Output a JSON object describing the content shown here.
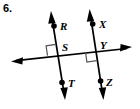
{
  "problem": {
    "number": "6."
  },
  "figure": {
    "type": "geometry-diagram",
    "stroke_color": "#000000",
    "background_color": "#ffffff",
    "points": [
      {
        "id": "R",
        "label": "R",
        "x": 54,
        "y": 26,
        "label_x": 60,
        "label_y": 29
      },
      {
        "id": "S",
        "label": "S",
        "x": 58,
        "y": 54,
        "label_x": 62,
        "label_y": 50
      },
      {
        "id": "T",
        "label": "T",
        "x": 62,
        "y": 83,
        "label_x": 67,
        "label_y": 86
      },
      {
        "id": "X",
        "label": "X",
        "x": 93,
        "y": 24,
        "label_x": 99,
        "label_y": 27
      },
      {
        "id": "Y",
        "label": "Y",
        "x": 96,
        "y": 51,
        "label_x": 100,
        "label_y": 48
      },
      {
        "id": "Z",
        "label": "Z",
        "x": 100,
        "y": 81,
        "label_x": 105,
        "label_y": 85
      }
    ],
    "lines": [
      {
        "id": "line-RT",
        "name": "left-vertical-line",
        "x1": 51,
        "y1": 12,
        "x2": 65,
        "y2": 99,
        "arrows": "both"
      },
      {
        "id": "line-XZ",
        "name": "right-vertical-line",
        "x1": 90,
        "y1": 10,
        "x2": 103,
        "y2": 99,
        "arrows": "both"
      },
      {
        "id": "line-transversal",
        "name": "horizontal-transversal-line",
        "x1": 12,
        "y1": 61,
        "x2": 131,
        "y2": 48,
        "arrows": "both"
      }
    ],
    "right_angles": [
      {
        "id": "angle-S",
        "vertex": "S",
        "position": "upper-left",
        "size": 9
      },
      {
        "id": "angle-Y",
        "vertex": "Y",
        "position": "lower-left",
        "size": 9
      }
    ]
  }
}
